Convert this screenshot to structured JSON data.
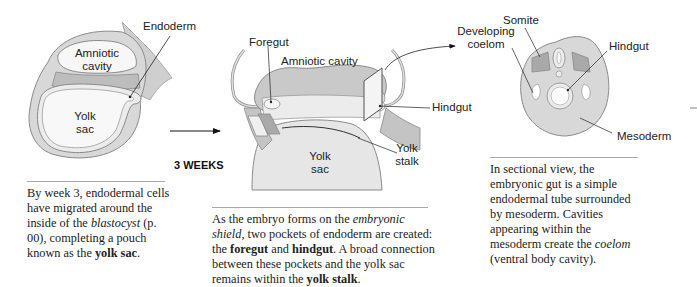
{
  "panels": [
    {
      "id": "panel-1",
      "labels": {
        "endoderm": "Endoderm",
        "amniotic_cavity_1": "Amniotic",
        "amniotic_cavity_2": "cavity",
        "yolk_sac_1": "Yolk",
        "yolk_sac_2": "sac"
      },
      "caption": {
        "parts": [
          {
            "text": "By week 3, endodermal cells have migrated around the inside of the ",
            "style": "normal"
          },
          {
            "text": "blastocyst",
            "style": "italic"
          },
          {
            "text": " (p. 00), completing a pouch known as the ",
            "style": "normal"
          },
          {
            "text": "yolk sac",
            "style": "bold"
          },
          {
            "text": ".",
            "style": "normal"
          }
        ]
      }
    },
    {
      "id": "panel-2",
      "stage_label": "3 WEEKS",
      "labels": {
        "foregut": "Foregut",
        "amniotic_cavity": "Amniotic cavity",
        "hindgut": "Hindgut",
        "yolk_stalk_1": "Yolk",
        "yolk_stalk_2": "stalk",
        "yolk_sac_1": "Yolk",
        "yolk_sac_2": "sac"
      },
      "caption": {
        "parts": [
          {
            "text": "As the embryo forms on the ",
            "style": "normal"
          },
          {
            "text": "embryonic shield",
            "style": "italic"
          },
          {
            "text": ", two pockets of endoderm are created: the ",
            "style": "normal"
          },
          {
            "text": "foregut",
            "style": "bold"
          },
          {
            "text": " and ",
            "style": "normal"
          },
          {
            "text": "hindgut",
            "style": "bold"
          },
          {
            "text": ". A broad connection between these pockets and the yolk sac remains within the ",
            "style": "normal"
          },
          {
            "text": "yolk stalk",
            "style": "bold"
          },
          {
            "text": ".",
            "style": "normal"
          }
        ]
      }
    },
    {
      "id": "panel-3",
      "labels": {
        "developing_coelom_1": "Developing",
        "developing_coelom_2": "coelom",
        "somite": "Somite",
        "hindgut": "Hindgut",
        "mesoderm": "Mesoderm"
      },
      "caption": {
        "parts": [
          {
            "text": "In sectional view, the embryonic gut is a simple endodermal tube surrounded by mesoderm. Cavities appearing within the mesoderm create the ",
            "style": "normal"
          },
          {
            "text": "coelom",
            "style": "italic"
          },
          {
            "text": " (ventral body cavity).",
            "style": "normal"
          }
        ]
      }
    }
  ],
  "colors": {
    "tissue_light": "#e4e4e4",
    "tissue_mid": "#cfcfcf",
    "tissue_dark": "#a9a9a9",
    "outline": "#8a8a8a",
    "cavity": "#f7f7f7",
    "rule": "#a8a8a8"
  }
}
